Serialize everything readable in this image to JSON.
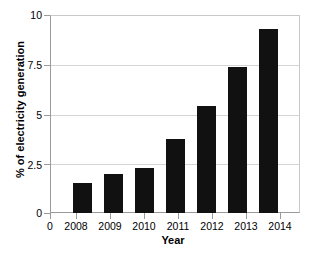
{
  "chart_data": {
    "type": "bar",
    "title": "",
    "subtitle": "",
    "xlabel": "Year",
    "ylabel": "% of electricity generation",
    "categories": [
      "2008",
      "2009",
      "2010",
      "2011",
      "2012",
      "2013",
      "2014"
    ],
    "values": [
      1.5,
      2.0,
      2.3,
      3.75,
      5.45,
      7.4,
      9.35
    ],
    "series": [
      {
        "name": "% of electricity generation",
        "values": [
          1.5,
          2.0,
          2.3,
          3.75,
          5.45,
          7.4,
          9.35
        ]
      }
    ],
    "xlim": [
      0,
      7
    ],
    "ylim": [
      0,
      10
    ],
    "yticks": [
      "0",
      "2.5",
      "5",
      "7.5",
      "10"
    ],
    "ytick_values": [
      0,
      2.5,
      5,
      7.5,
      10
    ],
    "xticks": [
      "0",
      "2008",
      "2009",
      "2010",
      "2011",
      "2012",
      "2013",
      "2014"
    ],
    "grid": "horizontal",
    "legend": "none",
    "bar_color": "#111111",
    "grid_color": "#d4d4d4",
    "axis_color": "#9a9a9a",
    "background_color": "#ffffff",
    "annotations": []
  }
}
